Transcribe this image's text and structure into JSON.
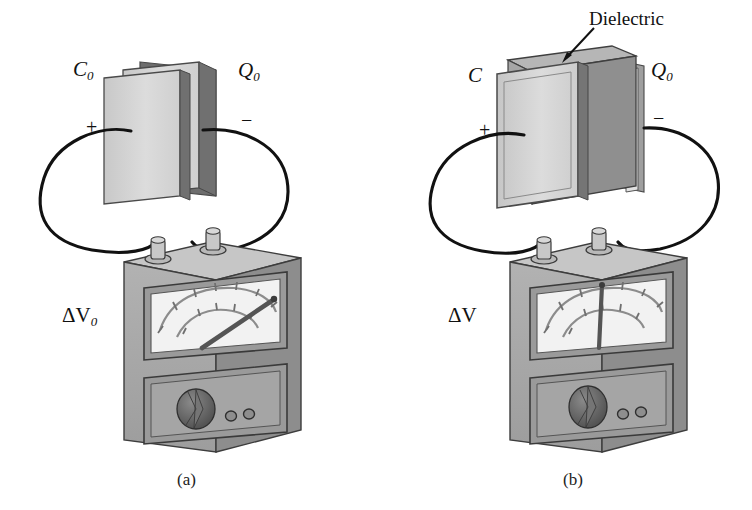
{
  "figure": {
    "type": "physics-diagram",
    "panels": [
      {
        "id": "a",
        "caption": "(a)",
        "capacitance_label": "C",
        "capacitance_sub": "0",
        "charge_label": "Q",
        "charge_sub": "0",
        "plus_sign": "+",
        "minus_sign": "−",
        "voltage_label": "ΔV",
        "voltage_sub": "0",
        "has_dielectric": false,
        "needle_angle_deg": 38,
        "meter_reading_description": "needle deflected far to the right (large reading)"
      },
      {
        "id": "b",
        "caption": "(b)",
        "capacitance_label": "C",
        "capacitance_sub": "",
        "charge_label": "Q",
        "charge_sub": "0",
        "plus_sign": "+",
        "minus_sign": "−",
        "voltage_label": "ΔV",
        "voltage_sub": "",
        "has_dielectric": true,
        "dielectric_label": "Dielectric",
        "needle_angle_deg": 0,
        "meter_reading_description": "needle vertical at center (smaller reading)"
      }
    ]
  },
  "colors": {
    "background": "#ffffff",
    "plate_face": "#d2d2d2",
    "plate_edge": "#6f6f6f",
    "plate_outline": "#4a4a4a",
    "dielectric_face": "#9a9a9a",
    "dielectric_top": "#b4b4b4",
    "meter_body": "#a8a8a8",
    "meter_top": "#c6c6c6",
    "meter_side": "#8d8d8d",
    "dial_face": "#f2f2f2",
    "knob": "#666666",
    "wire": "#111111",
    "text": "#111111"
  },
  "icons": {
    "dielectric_arrow": "arrow-down-left-icon",
    "meter_needle": "needle-icon",
    "meter_knob": "rotary-knob-icon",
    "terminal": "binding-post-icon"
  }
}
